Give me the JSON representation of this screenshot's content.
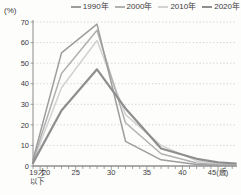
{
  "chart_data": {
    "type": "line",
    "title": "",
    "ylabel_unit": "(%)",
    "xlabel_unit": "(歳)",
    "ylim": [
      0,
      70
    ],
    "yticks": [
      0,
      10,
      20,
      30,
      40,
      50,
      60,
      70
    ],
    "x_range": [
      19,
      45
    ],
    "grid": "dotted-horizontal",
    "legend_position": "top",
    "xticks": [
      {
        "age": 19,
        "label": "19才",
        "label2": "以下",
        "dx": 4
      },
      {
        "age": 20,
        "label": "20",
        "dx": 6
      },
      {
        "age": 25,
        "label": "25"
      },
      {
        "age": 30,
        "label": "30"
      },
      {
        "age": 35,
        "label": "35"
      },
      {
        "age": 40,
        "label": "40"
      },
      {
        "age": 45,
        "label": "45(歳)"
      }
    ],
    "series": [
      {
        "name": "1990年",
        "color": "#9d9d9d",
        "width": 1.5,
        "points": [
          [
            19,
            3
          ],
          [
            23,
            55
          ],
          [
            28,
            69
          ],
          [
            32,
            12
          ],
          [
            37,
            3
          ],
          [
            42,
            0.8
          ],
          [
            45,
            0.3
          ],
          [
            47.5,
            0.2
          ]
        ]
      },
      {
        "name": "2000年",
        "color": "#b1b1b1",
        "width": 1.5,
        "points": [
          [
            19,
            2.5
          ],
          [
            23,
            45
          ],
          [
            28,
            66
          ],
          [
            32,
            21
          ],
          [
            37,
            6
          ],
          [
            42,
            1.5
          ],
          [
            45,
            0.6
          ],
          [
            47.5,
            0.4
          ]
        ]
      },
      {
        "name": "2010年",
        "color": "#d2d2d2",
        "width": 1.5,
        "points": [
          [
            19,
            2
          ],
          [
            23,
            38
          ],
          [
            28,
            61
          ],
          [
            32,
            25
          ],
          [
            37,
            10
          ],
          [
            42,
            2.5
          ],
          [
            45,
            1
          ],
          [
            47.5,
            0.7
          ]
        ]
      },
      {
        "name": "2020年",
        "color": "#8e8e8e",
        "width": 2.2,
        "points": [
          [
            19,
            1.5
          ],
          [
            23,
            27
          ],
          [
            28,
            47
          ],
          [
            32,
            28
          ],
          [
            37,
            8.5
          ],
          [
            42,
            3.5
          ],
          [
            45,
            1.8
          ],
          [
            47.5,
            1.2
          ]
        ]
      }
    ],
    "colors": {
      "grid": "#c4c4c4",
      "axis_x": "#5a5a5a",
      "axis_y": "#8a8a8a",
      "tick": "#8a8a8a"
    }
  }
}
